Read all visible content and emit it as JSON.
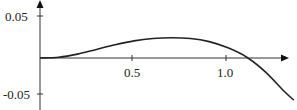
{
  "chart_data": {
    "type": "line",
    "title": "",
    "xlabel": "",
    "ylabel": "",
    "x_ticks": [
      "0.5",
      "1.0"
    ],
    "y_ticks": [
      "0.05",
      "-0.05"
    ],
    "xlim": [
      0,
      1.35
    ],
    "ylim": [
      -0.07,
      0.075
    ],
    "grid": false,
    "legend": null,
    "series": [
      {
        "name": "curve",
        "x": [
          0,
          0.1,
          0.2,
          0.3,
          0.4,
          0.5,
          0.6,
          0.7,
          0.8,
          0.9,
          1.0,
          1.1,
          1.2,
          1.3,
          1.35
        ],
        "y": [
          0,
          0.001,
          0.005,
          0.011,
          0.017,
          0.022,
          0.025,
          0.026,
          0.025,
          0.021,
          0.013,
          0.001,
          -0.018,
          -0.043,
          -0.054
        ]
      }
    ]
  },
  "labels": {
    "y_top": "0.05",
    "y_bottom": "-0.05",
    "x_mid": "0.5",
    "x_right": "1.0"
  }
}
